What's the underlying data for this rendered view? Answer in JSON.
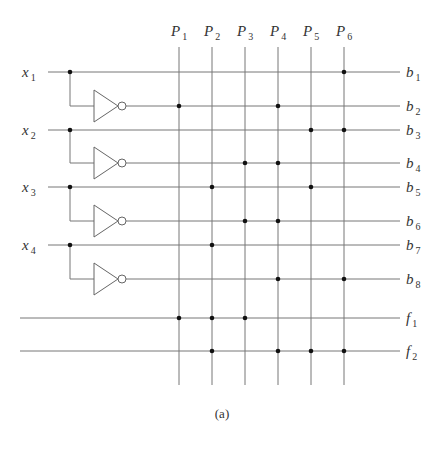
{
  "figure": {
    "caption": "(a)",
    "columns": [
      {
        "name": "P",
        "sub": "1",
        "x": 179
      },
      {
        "name": "P",
        "sub": "2",
        "x": 212
      },
      {
        "name": "P",
        "sub": "3",
        "x": 245
      },
      {
        "name": "P",
        "sub": "4",
        "x": 278
      },
      {
        "name": "P",
        "sub": "5",
        "x": 311
      },
      {
        "name": "P",
        "sub": "6",
        "x": 344
      }
    ],
    "inputs": [
      {
        "name": "x",
        "sub": "1",
        "y": 72
      },
      {
        "name": "x",
        "sub": "2",
        "y": 130
      },
      {
        "name": "x",
        "sub": "3",
        "y": 187
      },
      {
        "name": "x",
        "sub": "4",
        "y": 245
      }
    ],
    "rows": [
      {
        "name": "b",
        "sub": "1",
        "y": 72,
        "source": "input",
        "dots": [
          6
        ]
      },
      {
        "name": "b",
        "sub": "2",
        "y": 106,
        "source": "inverter",
        "dots": [
          1,
          4
        ]
      },
      {
        "name": "b",
        "sub": "3",
        "y": 130,
        "source": "input",
        "dots": [
          5,
          6
        ]
      },
      {
        "name": "b",
        "sub": "4",
        "y": 163,
        "source": "inverter",
        "dots": [
          3,
          4
        ]
      },
      {
        "name": "b",
        "sub": "5",
        "y": 187,
        "source": "input",
        "dots": [
          2,
          5
        ]
      },
      {
        "name": "b",
        "sub": "6",
        "y": 221,
        "source": "inverter",
        "dots": [
          3,
          4
        ]
      },
      {
        "name": "b",
        "sub": "7",
        "y": 245,
        "source": "input",
        "dots": [
          2
        ]
      },
      {
        "name": "b",
        "sub": "8",
        "y": 279,
        "source": "inverter",
        "dots": [
          4,
          6
        ]
      },
      {
        "name": "f",
        "sub": "1",
        "y": 318,
        "source": "output",
        "dots": [
          1,
          2,
          3
        ]
      },
      {
        "name": "f",
        "sub": "2",
        "y": 351,
        "source": "output",
        "dots": [
          2,
          4,
          5,
          6
        ]
      }
    ],
    "colors": {
      "wire": "#777777",
      "dot": "#111111",
      "text": "#333333"
    }
  }
}
